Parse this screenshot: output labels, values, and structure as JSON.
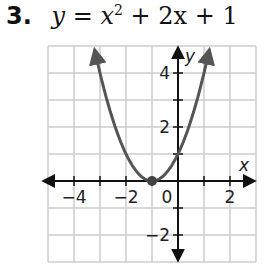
{
  "problem": {
    "number": "3.",
    "equation_lhs": "y",
    "equation_eq": " = ",
    "equation_x": "x",
    "equation_exp": "2",
    "equation_rest": " + 2x + 1"
  },
  "chart_data": {
    "type": "line",
    "xlabel": "x",
    "ylabel": "y",
    "xlim": [
      -5,
      3
    ],
    "ylim": [
      -3,
      5
    ],
    "grid": true,
    "x_ticks": [
      -4,
      -2,
      0,
      2
    ],
    "y_ticks": [
      -2,
      2,
      4
    ],
    "x_tick_labels": [
      "−4",
      "−2",
      "0",
      "2"
    ],
    "y_tick_labels": [
      "−2",
      "2",
      "4"
    ],
    "series": [
      {
        "name": "y = x^2 + 2x + 1",
        "x": [
          -3.2,
          -3,
          -2.5,
          -2,
          -1.5,
          -1,
          -0.5,
          0,
          0.5,
          1.2
        ],
        "y": [
          4.84,
          4,
          2.25,
          1,
          0.25,
          0,
          0.25,
          1,
          2.25,
          4.84
        ],
        "color": "#555555",
        "arrows_at_ends": true
      }
    ],
    "annotations": [
      {
        "type": "point",
        "x": -1,
        "y": 0,
        "label": "vertex"
      }
    ]
  },
  "colors": {
    "grid": "#cccccc",
    "axis": "#111111",
    "curve": "#555555"
  }
}
